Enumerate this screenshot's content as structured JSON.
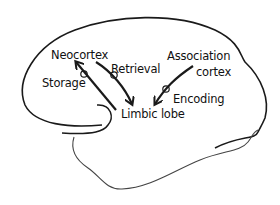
{
  "diagram": {
    "type": "brain-memory-pathways",
    "colors": {
      "stroke": "#1a1a1a",
      "thin_stroke": "#444444",
      "background": "#ffffff",
      "text": "#111111"
    },
    "labels": {
      "neocortex": "Neocortex",
      "retrieval": "Retrieval",
      "association_line1": "Association",
      "association_line2": "cortex",
      "storage": "Storage",
      "encoding": "Encoding",
      "limbic_lobe": "Limbic lobe"
    },
    "edges": [
      {
        "from": "Limbic lobe",
        "to": "Neocortex",
        "label": "Storage"
      },
      {
        "from": "Neocortex",
        "to": "Limbic lobe",
        "label": "Retrieval"
      },
      {
        "from": "Association cortex",
        "to": "Limbic lobe",
        "label": "Encoding"
      }
    ]
  }
}
